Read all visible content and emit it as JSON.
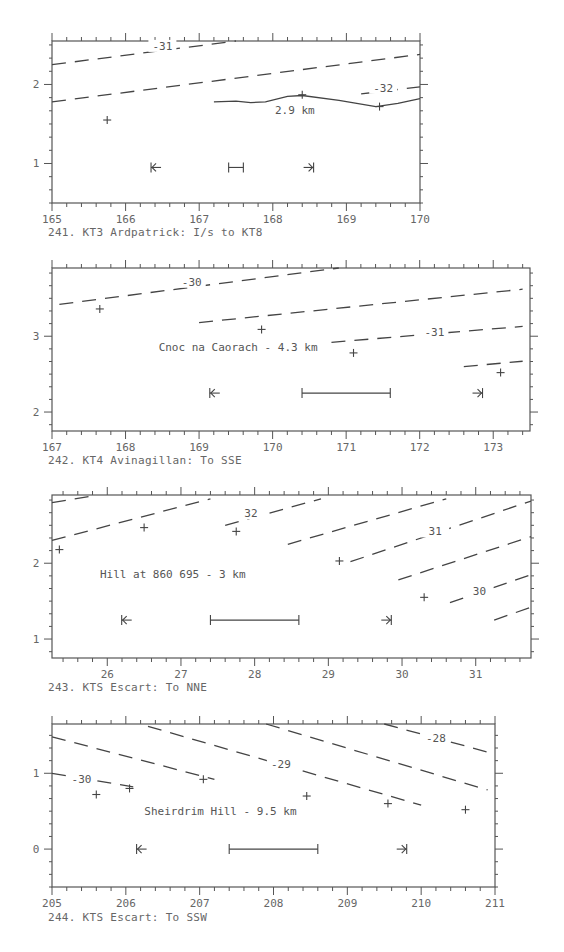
{
  "chart_data": [
    {
      "id": "241",
      "type": "line",
      "title": "241. KT3 Ardpatrick: I/s to KT8",
      "frame": {
        "left": 52,
        "top": 41,
        "right": 420,
        "bottom": 203
      },
      "xlim": [
        165,
        170
      ],
      "ylim": [
        0.5,
        2.55
      ],
      "x_ticks": [
        165,
        166,
        167,
        168,
        169,
        170
      ],
      "x_tick_labels": [
        "165",
        "166",
        "167",
        "168",
        "169",
        "170"
      ],
      "y_ticks": [
        1,
        2
      ],
      "y_tick_labels": [
        "1",
        "2"
      ],
      "contours": [
        {
          "label": "-31",
          "points": [
            [
              165,
              2.25
            ],
            [
              167.5,
              2.55
            ]
          ],
          "label_at": [
            166.5,
            2.45
          ]
        },
        {
          "label": "",
          "points": [
            [
              165,
              1.78
            ],
            [
              170,
              2.38
            ]
          ]
        },
        {
          "label": "-32",
          "points": [
            [
              169.2,
              1.88
            ],
            [
              170,
              1.97
            ]
          ],
          "label_at": [
            169.5,
            1.92
          ]
        }
      ],
      "profile_line": {
        "label": "2.9 km",
        "label_at": [
          168.3,
          1.62
        ],
        "points": [
          [
            167.2,
            1.78
          ],
          [
            167.5,
            1.79
          ],
          [
            167.7,
            1.77
          ],
          [
            167.9,
            1.78
          ],
          [
            168.2,
            1.85
          ],
          [
            168.4,
            1.86
          ],
          [
            168.9,
            1.8
          ],
          [
            169.4,
            1.72
          ],
          [
            169.7,
            1.76
          ],
          [
            170,
            1.82
          ]
        ]
      },
      "points": [
        [
          165.75,
          1.55
        ],
        [
          168.4,
          1.87
        ],
        [
          169.45,
          1.72
        ]
      ],
      "markers": {
        "left_arrow": [
          166.4,
          0.95
        ],
        "right_arrow": [
          168.5,
          0.95
        ],
        "scale_bar": [
          167.4,
          167.6,
          0.95
        ]
      },
      "annotation": ""
    },
    {
      "id": "242",
      "type": "line",
      "title": "242. KT4 Avinagillan: To SSE",
      "frame": {
        "left": 52,
        "top": 268,
        "right": 530,
        "bottom": 431
      },
      "xlim": [
        167,
        173.5
      ],
      "ylim": [
        1.75,
        3.9
      ],
      "x_ticks": [
        167,
        168,
        169,
        170,
        171,
        172,
        173
      ],
      "x_tick_labels": [
        "167",
        "168",
        "169",
        "170",
        "171",
        "172",
        "173"
      ],
      "y_ticks": [
        2,
        3
      ],
      "y_tick_labels": [
        "2",
        "3"
      ],
      "contours": [
        {
          "label": "-30",
          "points": [
            [
              167.1,
              3.42
            ],
            [
              170.9,
              3.9
            ]
          ],
          "label_at": [
            168.9,
            3.68
          ]
        },
        {
          "label": "",
          "points": [
            [
              169.0,
              3.18
            ],
            [
              173.4,
              3.62
            ]
          ]
        },
        {
          "label": "-31",
          "points": [
            [
              170.8,
              2.92
            ],
            [
              173.4,
              3.13
            ]
          ],
          "label_at": [
            172.2,
            3.02
          ]
        },
        {
          "label": "",
          "points": [
            [
              172.6,
              2.6
            ],
            [
              173.4,
              2.67
            ]
          ]
        }
      ],
      "points": [
        [
          167.65,
          3.36
        ],
        [
          169.85,
          3.09
        ],
        [
          171.1,
          2.78
        ],
        [
          173.1,
          2.52
        ]
      ],
      "markers": {
        "left_arrow": [
          169.2,
          2.25
        ],
        "right_arrow": [
          172.8,
          2.25
        ],
        "scale_bar": [
          170.4,
          171.6,
          2.25
        ]
      },
      "annotation": "Cnoc na Caorach - 4.3 km",
      "annotation_at": [
        168.45,
        2.8
      ]
    },
    {
      "id": "243",
      "type": "line",
      "title": "243. KTS Escart: To NNE",
      "frame": {
        "left": 52,
        "top": 495,
        "right": 531,
        "bottom": 658
      },
      "xlim": [
        25.25,
        31.75
      ],
      "ylim": [
        0.75,
        2.9
      ],
      "x_ticks": [
        26,
        27,
        28,
        29,
        30,
        31
      ],
      "x_tick_labels": [
        "26",
        "27",
        "28",
        "29",
        "30",
        "31"
      ],
      "y_ticks": [
        1,
        2
      ],
      "y_tick_labels": [
        "1",
        "2"
      ],
      "contours": [
        {
          "label": "",
          "points": [
            [
              25.25,
              2.8
            ],
            [
              25.75,
              2.88
            ]
          ]
        },
        {
          "label": "",
          "points": [
            [
              25.25,
              2.3
            ],
            [
              27.4,
              2.85
            ]
          ]
        },
        {
          "label": "32",
          "points": [
            [
              27.6,
              2.5
            ],
            [
              28.9,
              2.85
            ]
          ],
          "label_at": [
            27.95,
            2.62
          ]
        },
        {
          "label": "",
          "points": [
            [
              28.45,
              2.25
            ],
            [
              30.6,
              2.85
            ]
          ]
        },
        {
          "label": "31",
          "points": [
            [
              29.3,
              2.02
            ],
            [
              31.75,
              2.82
            ]
          ],
          "label_at": [
            30.45,
            2.38
          ]
        },
        {
          "label": "",
          "points": [
            [
              29.95,
              1.78
            ],
            [
              31.75,
              2.35
            ]
          ]
        },
        {
          "label": "30",
          "points": [
            [
              30.65,
              1.48
            ],
            [
              31.75,
              1.85
            ]
          ],
          "label_at": [
            31.05,
            1.6
          ]
        },
        {
          "label": "",
          "points": [
            [
              31.25,
              1.25
            ],
            [
              31.75,
              1.42
            ]
          ]
        }
      ],
      "points": [
        [
          25.35,
          2.18
        ],
        [
          26.5,
          2.47
        ],
        [
          27.75,
          2.42
        ],
        [
          29.15,
          2.03
        ],
        [
          30.3,
          1.55
        ]
      ],
      "markers": {
        "left_arrow": [
          26.25,
          1.25
        ],
        "right_arrow": [
          29.8,
          1.25
        ],
        "scale_bar": [
          27.4,
          28.6,
          1.25
        ]
      },
      "annotation": "Hill at 860 695 - 3 km",
      "annotation_at": [
        25.9,
        1.8
      ]
    },
    {
      "id": "244",
      "type": "line",
      "title": "244. KTS Escart: To SSW",
      "frame": {
        "left": 52,
        "top": 724,
        "right": 495,
        "bottom": 887
      },
      "xlim": [
        205,
        211
      ],
      "ylim": [
        -0.5,
        1.65
      ],
      "x_ticks": [
        205,
        206,
        207,
        208,
        209,
        210,
        211
      ],
      "x_tick_labels": [
        "205",
        "206",
        "207",
        "208",
        "209",
        "210",
        "211"
      ],
      "y_ticks": [
        0,
        1
      ],
      "y_tick_labels": [
        "0",
        "1"
      ],
      "contours": [
        {
          "label": "-30",
          "points": [
            [
              205,
              1.0
            ],
            [
              206.1,
              0.82
            ]
          ],
          "label_at": [
            205.4,
            0.88
          ]
        },
        {
          "label": "",
          "points": [
            [
              205,
              1.48
            ],
            [
              207.2,
              0.92
            ]
          ]
        },
        {
          "label": "-29",
          "points": [
            [
              206.3,
              1.62
            ],
            [
              210.0,
              0.58
            ]
          ],
          "label_at": [
            208.1,
            1.08
          ]
        },
        {
          "label": "",
          "points": [
            [
              207.9,
              1.65
            ],
            [
              210.9,
              0.78
            ]
          ]
        },
        {
          "label": "-28",
          "points": [
            [
              209.5,
              1.65
            ],
            [
              210.9,
              1.28
            ]
          ],
          "label_at": [
            210.2,
            1.42
          ]
        }
      ],
      "points": [
        [
          205.6,
          0.72
        ],
        [
          206.05,
          0.8
        ],
        [
          207.05,
          0.92
        ],
        [
          208.45,
          0.7
        ],
        [
          209.55,
          0.6
        ],
        [
          210.6,
          0.52
        ]
      ],
      "markers": {
        "left_arrow": [
          206.2,
          0.0
        ],
        "right_arrow": [
          209.75,
          0.0
        ],
        "scale_bar": [
          207.4,
          208.6,
          0.0
        ]
      },
      "annotation": "Sheirdrim Hill - 9.5 km",
      "annotation_at": [
        206.25,
        0.45
      ]
    }
  ],
  "captions": {
    "c241": "241. KT3 Ardpatrick: I/s to KT8",
    "c242": "242. KT4 Avinagillan: To SSE",
    "c243": "243. KTS Escart: To NNE",
    "c244": "244. KTS Escart: To SSW"
  }
}
